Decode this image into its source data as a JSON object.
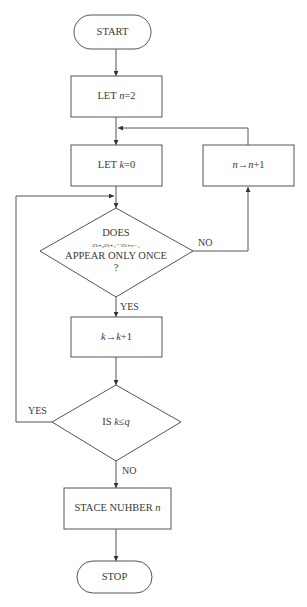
{
  "diagram": {
    "type": "flowchart",
    "nodes": {
      "start": {
        "kind": "terminal",
        "text": "START"
      },
      "let_n": {
        "kind": "process",
        "prefix": "LET ",
        "var": "n",
        "suffix": "=2"
      },
      "let_k": {
        "kind": "process",
        "prefix": "LET ",
        "var": "k",
        "suffix": "=0"
      },
      "inc_n": {
        "kind": "process",
        "var": "n",
        "arrow": "→",
        "var2": "n",
        "suffix": "+1"
      },
      "does": {
        "kind": "decision",
        "line1": "DOES",
        "formula": "cₖ₊₀cₖ₊₁···cₖ₊ₙ₋₁",
        "line3": "APPEAR ONLY ONCE",
        "line4": "?"
      },
      "inc_k": {
        "kind": "process",
        "var": "k",
        "arrow": "→",
        "var2": "k",
        "suffix": "+1"
      },
      "is_k": {
        "kind": "decision",
        "prefix": "IS ",
        "var": "k",
        "op": "≤",
        "var2": "q"
      },
      "stace": {
        "kind": "process",
        "prefix": "STACE NUHBER ",
        "var": "n"
      },
      "stop": {
        "kind": "terminal",
        "text": "STOP"
      }
    },
    "edges": [
      {
        "from": "start",
        "to": "let_n",
        "label": ""
      },
      {
        "from": "let_n",
        "to": "let_k",
        "label": ""
      },
      {
        "from": "let_k",
        "to": "does",
        "label": ""
      },
      {
        "from": "does",
        "to": "inc_n",
        "label": "NO"
      },
      {
        "from": "inc_n",
        "to": "let_k",
        "label": ""
      },
      {
        "from": "does",
        "to": "inc_k",
        "label": "YES"
      },
      {
        "from": "inc_k",
        "to": "is_k",
        "label": ""
      },
      {
        "from": "is_k",
        "to": "does",
        "label": "YES"
      },
      {
        "from": "is_k",
        "to": "stace",
        "label": "NO"
      },
      {
        "from": "stace",
        "to": "stop",
        "label": ""
      }
    ],
    "edge_labels": {
      "does_no": "NO",
      "does_yes": "YES",
      "is_k_yes": "YES",
      "is_k_no": "NO"
    }
  }
}
